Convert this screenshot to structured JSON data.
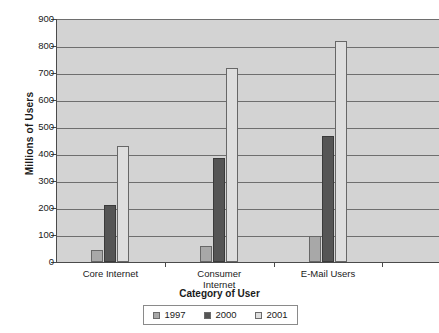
{
  "chart_data": {
    "type": "bar",
    "title": "",
    "xlabel": "Category of User",
    "ylabel": "Millions of Users",
    "categories": [
      "Core Internet",
      "Consumer Internet",
      "E-Mail Users"
    ],
    "series": [
      {
        "name": "1997",
        "color": "#a8a8a8",
        "values": [
          45,
          60,
          95
        ]
      },
      {
        "name": "2000",
        "color": "#555555",
        "values": [
          210,
          385,
          465
        ]
      },
      {
        "name": "2001",
        "color": "#dedede",
        "values": [
          430,
          720,
          820
        ]
      }
    ],
    "ylim": [
      0,
      900
    ],
    "ytick_step": 100,
    "ytick_labels": [
      "900",
      "800",
      "700",
      "600",
      "500",
      "400",
      "300",
      "200",
      "100",
      "0"
    ],
    "grid": true,
    "legend_position": "bottom",
    "plot_background": "#d3d3d3",
    "gridline_color": "#6e6e6e",
    "axis_color": "#4a4a4a"
  },
  "axis": {
    "y_title": "Millions of Users",
    "x_title": "Category of User"
  },
  "categories": [
    {
      "label": "Core Internet"
    },
    {
      "label": "Consumer\nInternet"
    },
    {
      "label": "E-Mail Users"
    }
  ],
  "legend": {
    "items": [
      {
        "label": "1997",
        "color": "#a8a8a8"
      },
      {
        "label": "2000",
        "color": "#555555"
      },
      {
        "label": "2001",
        "color": "#dedede"
      }
    ]
  }
}
